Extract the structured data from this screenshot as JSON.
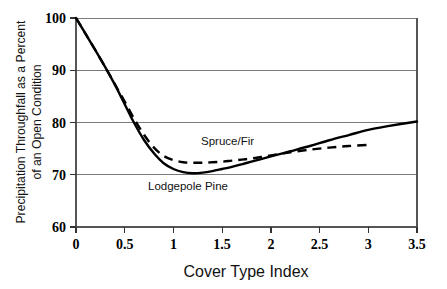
{
  "chart_data": {
    "type": "line",
    "title": "",
    "xlabel": "Cover Type Index",
    "ylabel": "Precipitation Throughfall as a Percent of an Open Condition",
    "ylabel_line1": "Precipitation Throughfall as a Percent",
    "ylabel_line2": "of an Open Condition",
    "xlim": [
      0,
      3.5
    ],
    "ylim": [
      60,
      100
    ],
    "xticks": [
      "0",
      "0.5",
      "1",
      "1.5",
      "2",
      "2.5",
      "3",
      "3.5"
    ],
    "xtick_values": [
      0,
      0.5,
      1,
      1.5,
      2,
      2.5,
      3,
      3.5
    ],
    "yticks": [
      "60",
      "70",
      "80",
      "90",
      "100"
    ],
    "ytick_values": [
      60,
      70,
      80,
      90,
      100
    ],
    "grid": "horizontal",
    "legend": "inline-annotations",
    "line_color": "#000000",
    "grid_color": "#7a7a7a",
    "series": [
      {
        "name": "Lodgepole Pine",
        "style": "solid",
        "annotation": "Lodgepole Pine",
        "x": [
          0,
          0.1,
          0.2,
          0.3,
          0.4,
          0.5,
          0.6,
          0.7,
          0.8,
          0.9,
          1.0,
          1.1,
          1.2,
          1.3,
          1.4,
          1.5,
          1.6,
          1.7,
          1.8,
          1.9,
          2.0,
          2.1,
          2.2,
          2.4,
          2.6,
          2.8,
          3.0,
          3.2,
          3.5
        ],
        "y": [
          100.0,
          96.9,
          93.8,
          90.6,
          87.2,
          83.5,
          79.8,
          76.6,
          74.1,
          72.2,
          71.1,
          70.5,
          70.3,
          70.4,
          70.7,
          71.1,
          71.5,
          72.0,
          72.5,
          73.0,
          73.5,
          74.0,
          74.5,
          75.5,
          76.6,
          77.6,
          78.6,
          79.3,
          80.2
        ]
      },
      {
        "name": "Spruce/Fir",
        "style": "dashed",
        "annotation": "Spruce/Fir",
        "x": [
          0,
          0.1,
          0.2,
          0.3,
          0.4,
          0.5,
          0.6,
          0.7,
          0.8,
          0.9,
          1.0,
          1.1,
          1.2,
          1.3,
          1.4,
          1.5,
          1.6,
          1.7,
          1.8,
          1.9,
          2.0,
          2.1,
          2.2,
          2.4,
          2.6,
          2.8,
          3.0
        ],
        "y": [
          100.0,
          96.9,
          93.8,
          90.6,
          87.3,
          84.0,
          80.6,
          77.6,
          75.2,
          73.6,
          72.8,
          72.4,
          72.3,
          72.3,
          72.4,
          72.5,
          72.7,
          72.9,
          73.1,
          73.4,
          73.7,
          74.0,
          74.3,
          74.8,
          75.2,
          75.5,
          75.7
        ]
      }
    ],
    "annotations": [
      {
        "label": "Spruce/Fir",
        "x": 1.5,
        "y": 76.5
      },
      {
        "label": "Lodgepole Pine",
        "x": 1.0,
        "y": 68.0
      }
    ]
  }
}
